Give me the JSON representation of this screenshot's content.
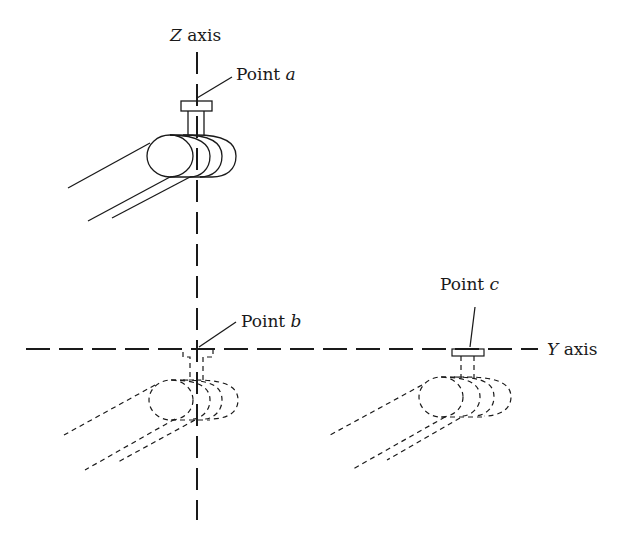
{
  "diagram": {
    "labels": {
      "z_axis": {
        "italic": "Z",
        "text": " axis"
      },
      "y_axis": {
        "italic": "Y",
        "text": " axis"
      },
      "point_a": {
        "text": "Point ",
        "italic": "a"
      },
      "point_b": {
        "text": "Point ",
        "italic": "b"
      },
      "point_c": {
        "text": "Point ",
        "italic": "c"
      }
    },
    "elements": [
      "Z axis (vertical dash-dot line)",
      "Y axis (horizontal dashed line)",
      "tool at point a (solid, on Z axis)",
      "tool at point b (hidden/dashed, origin)",
      "tool at point c (hidden/dashed, on Y axis)"
    ],
    "colors": {
      "ink": "#1a1a1a",
      "background": "#ffffff"
    }
  }
}
